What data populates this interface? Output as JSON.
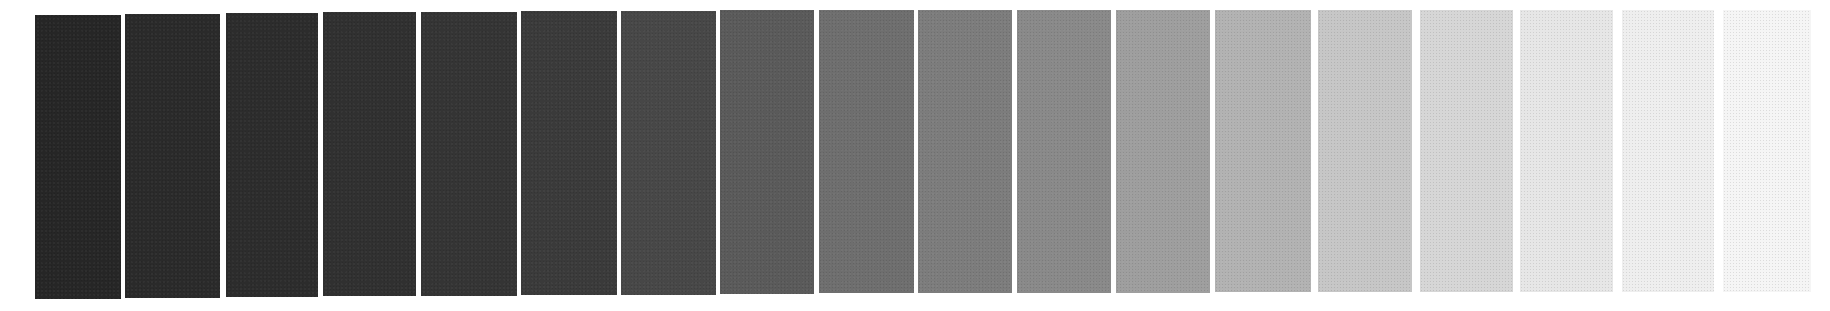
{
  "wedge": {
    "description": "Grayscale step wedge (tonal scale), dark to light",
    "step_count": 18,
    "background": "#ffffff",
    "steps": [
      {
        "index": 1,
        "color": "#262626",
        "left": 35,
        "top": 15,
        "width": 86,
        "height": 284
      },
      {
        "index": 2,
        "color": "#2a2a2a",
        "left": 125,
        "top": 14,
        "width": 95,
        "height": 284
      },
      {
        "index": 3,
        "color": "#2c2c2c",
        "left": 226,
        "top": 13,
        "width": 92,
        "height": 284
      },
      {
        "index": 4,
        "color": "#303030",
        "left": 323,
        "top": 12,
        "width": 93,
        "height": 284
      },
      {
        "index": 5,
        "color": "#343434",
        "left": 421,
        "top": 12,
        "width": 96,
        "height": 284
      },
      {
        "index": 6,
        "color": "#3a3a3a",
        "left": 521,
        "top": 11,
        "width": 96,
        "height": 284
      },
      {
        "index": 7,
        "color": "#474747",
        "left": 621,
        "top": 11,
        "width": 95,
        "height": 284
      },
      {
        "index": 8,
        "color": "#5a5a5a",
        "left": 720,
        "top": 10,
        "width": 94,
        "height": 284
      },
      {
        "index": 9,
        "color": "#6e6e6e",
        "left": 819,
        "top": 10,
        "width": 95,
        "height": 283
      },
      {
        "index": 10,
        "color": "#7c7c7c",
        "left": 918,
        "top": 10,
        "width": 94,
        "height": 283
      },
      {
        "index": 11,
        "color": "#898989",
        "left": 1017,
        "top": 10,
        "width": 94,
        "height": 283
      },
      {
        "index": 12,
        "color": "#9e9e9e",
        "left": 1116,
        "top": 10,
        "width": 94,
        "height": 283
      },
      {
        "index": 13,
        "color": "#b2b2b2",
        "left": 1215,
        "top": 10,
        "width": 96,
        "height": 282
      },
      {
        "index": 14,
        "color": "#c6c6c6",
        "left": 1318,
        "top": 10,
        "width": 94,
        "height": 282
      },
      {
        "index": 15,
        "color": "#d6d6d6",
        "left": 1420,
        "top": 10,
        "width": 93,
        "height": 282
      },
      {
        "index": 16,
        "color": "#e6e6e6",
        "left": 1520,
        "top": 10,
        "width": 93,
        "height": 282
      },
      {
        "index": 17,
        "color": "#eeeeee",
        "left": 1622,
        "top": 10,
        "width": 92,
        "height": 282
      },
      {
        "index": 18,
        "color": "#f5f5f5",
        "left": 1723,
        "top": 10,
        "width": 88,
        "height": 282
      }
    ]
  }
}
